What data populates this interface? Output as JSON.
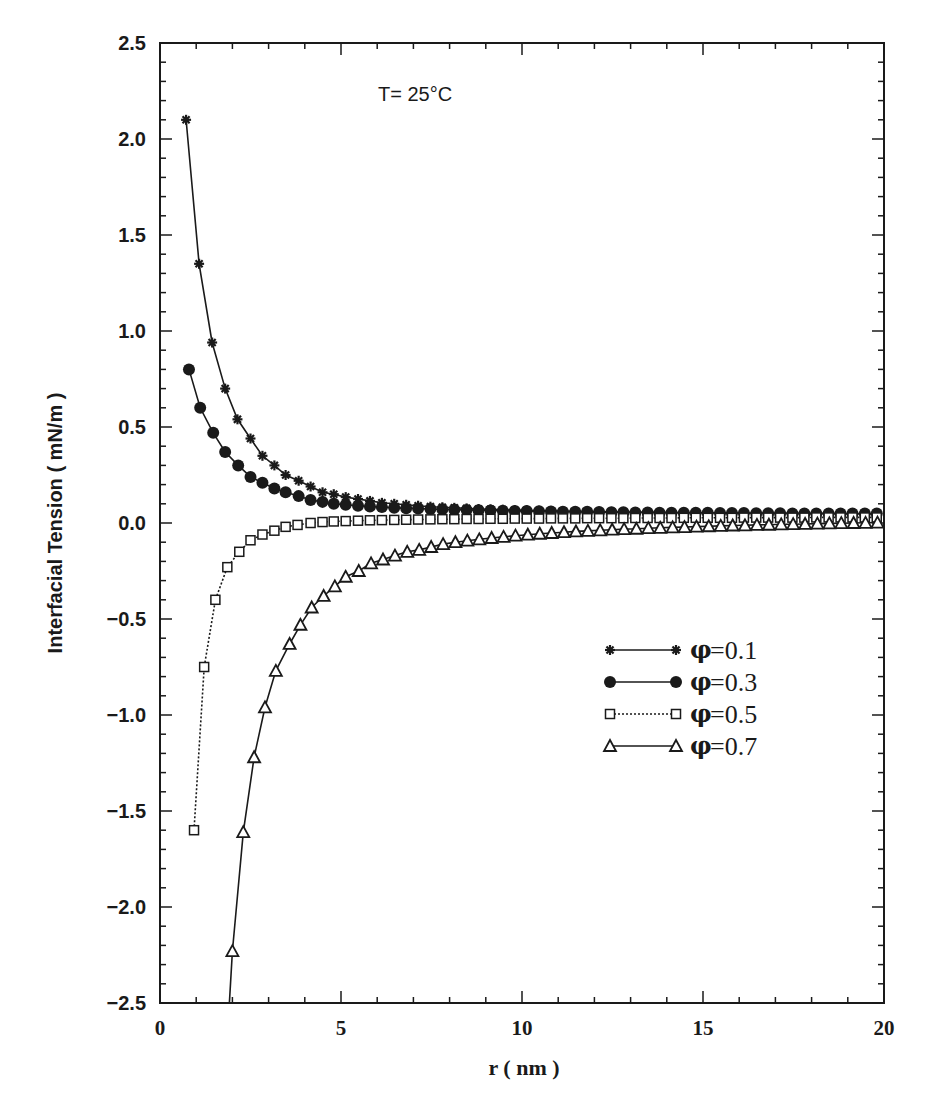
{
  "chart_data": {
    "type": "line",
    "title": "",
    "annotation": "T= 25°C",
    "xlabel": "r ( nm )",
    "ylabel": "Interfacial Tension ( mN/m )",
    "xlim": [
      0,
      20
    ],
    "ylim": [
      -2.5,
      2.5
    ],
    "x_ticks": [
      0,
      5,
      10,
      15,
      20
    ],
    "x_tick_labels": [
      "0",
      "5",
      "10",
      "15",
      "20"
    ],
    "y_ticks": [
      2.5,
      2.0,
      1.5,
      1.0,
      0.5,
      0.0,
      -0.5,
      -1.0,
      -1.5,
      -2.0,
      -2.5
    ],
    "y_tick_labels": [
      "2.5",
      "2.0",
      "1.5",
      "1.0",
      "0.5",
      "0.0",
      "-0.5",
      "-1.0",
      "-1.5",
      "-2.0",
      "-2.5"
    ],
    "grid": false,
    "legend_position": "center-right",
    "series": [
      {
        "name": "φ= 0.1",
        "legend_symbol": "φ",
        "legend_value": "= 0.1",
        "marker": "asterisk",
        "line": "solid",
        "x": [
          0.72,
          1.08,
          1.44,
          1.8,
          2.14,
          2.5,
          2.83,
          3.16,
          3.47,
          3.83,
          4.16,
          4.49,
          4.8,
          5.13,
          5.47,
          5.8,
          6.13,
          6.47,
          6.8,
          7.13,
          7.47,
          7.8,
          8.13,
          8.47,
          8.8,
          9.13,
          9.47,
          9.8,
          10.13,
          10.47,
          10.8,
          11.13,
          11.47,
          11.8,
          12.13,
          12.47,
          12.8,
          13.13,
          13.47,
          13.8,
          14.13,
          14.47,
          14.8,
          15.13,
          15.47,
          15.8,
          16.13,
          16.47,
          16.8,
          17.13,
          17.47,
          17.8,
          18.13,
          18.47,
          18.8,
          19.13,
          19.47,
          19.8
        ],
        "values": [
          2.1,
          1.35,
          0.94,
          0.7,
          0.54,
          0.44,
          0.35,
          0.3,
          0.25,
          0.22,
          0.19,
          0.16,
          0.15,
          0.135,
          0.125,
          0.115,
          0.105,
          0.1,
          0.095,
          0.09,
          0.085,
          0.082,
          0.079,
          0.076,
          0.073,
          0.071,
          0.069,
          0.067,
          0.066,
          0.064,
          0.063,
          0.062,
          0.061,
          0.06,
          0.059,
          0.058,
          0.057,
          0.056,
          0.056,
          0.055,
          0.054,
          0.054,
          0.053,
          0.053,
          0.052,
          0.052,
          0.051,
          0.051,
          0.05,
          0.05,
          0.05,
          0.049,
          0.049,
          0.049,
          0.048,
          0.048,
          0.048,
          0.047
        ]
      },
      {
        "name": "φ= 0.3",
        "legend_symbol": "φ",
        "legend_value": "= 0.3",
        "marker": "filled-circle",
        "line": "solid",
        "x": [
          0.8,
          1.11,
          1.47,
          1.8,
          2.16,
          2.5,
          2.83,
          3.16,
          3.47,
          3.83,
          4.16,
          4.49,
          4.8,
          5.13,
          5.47,
          5.8,
          6.13,
          6.47,
          6.8,
          7.13,
          7.47,
          7.8,
          8.13,
          8.47,
          8.8,
          9.13,
          9.47,
          9.8,
          10.13,
          10.47,
          10.8,
          11.13,
          11.47,
          11.8,
          12.13,
          12.47,
          12.8,
          13.13,
          13.47,
          13.8,
          14.13,
          14.47,
          14.8,
          15.13,
          15.47,
          15.8,
          16.13,
          16.47,
          16.8,
          17.13,
          17.47,
          17.8,
          18.13,
          18.47,
          18.8,
          19.13,
          19.47,
          19.8
        ],
        "values": [
          0.8,
          0.6,
          0.47,
          0.37,
          0.3,
          0.24,
          0.21,
          0.18,
          0.16,
          0.14,
          0.12,
          0.11,
          0.1,
          0.095,
          0.09,
          0.086,
          0.083,
          0.08,
          0.077,
          0.075,
          0.073,
          0.071,
          0.069,
          0.068,
          0.066,
          0.065,
          0.064,
          0.063,
          0.062,
          0.061,
          0.06,
          0.059,
          0.058,
          0.058,
          0.057,
          0.056,
          0.056,
          0.055,
          0.055,
          0.054,
          0.054,
          0.053,
          0.053,
          0.053,
          0.052,
          0.052,
          0.052,
          0.051,
          0.051,
          0.051,
          0.05,
          0.05,
          0.05,
          0.05,
          0.049,
          0.049,
          0.049,
          0.049
        ]
      },
      {
        "name": "φ= 0.5",
        "legend_symbol": "φ",
        "legend_value": "= 0.5",
        "marker": "open-square",
        "line": "dotted",
        "x": [
          0.94,
          1.22,
          1.53,
          1.86,
          2.19,
          2.5,
          2.83,
          3.16,
          3.47,
          3.8,
          4.16,
          4.49,
          4.8,
          5.13,
          5.47,
          5.8,
          6.13,
          6.47,
          6.8,
          7.13,
          7.47,
          7.8,
          8.13,
          8.47,
          8.8,
          9.13,
          9.47,
          9.8,
          10.13,
          10.47,
          10.8,
          11.13,
          11.47,
          11.8,
          12.13,
          12.47,
          12.8,
          13.13,
          13.47,
          13.8,
          14.13,
          14.47,
          14.8,
          15.13,
          15.47,
          15.8,
          16.13,
          16.47,
          16.8,
          17.13,
          17.47,
          17.8,
          18.13,
          18.47,
          18.8,
          19.13,
          19.47,
          19.8
        ],
        "values": [
          -1.6,
          -0.75,
          -0.4,
          -0.23,
          -0.15,
          -0.09,
          -0.06,
          -0.04,
          -0.02,
          -0.01,
          0.0,
          0.005,
          0.008,
          0.01,
          0.012,
          0.014,
          0.015,
          0.016,
          0.017,
          0.018,
          0.019,
          0.02,
          0.02,
          0.021,
          0.021,
          0.022,
          0.022,
          0.023,
          0.023,
          0.023,
          0.024,
          0.024,
          0.024,
          0.025,
          0.025,
          0.025,
          0.025,
          0.026,
          0.026,
          0.026,
          0.026,
          0.027,
          0.027,
          0.027,
          0.027,
          0.027,
          0.028,
          0.028,
          0.028,
          0.028,
          0.028,
          0.028,
          0.029,
          0.029,
          0.029,
          0.029,
          0.029,
          0.029
        ]
      },
      {
        "name": "φ= 0.7",
        "legend_symbol": "φ",
        "legend_value": "= 0.7",
        "marker": "open-triangle",
        "line": "solid",
        "x": [
          2.0,
          2.3,
          2.6,
          2.9,
          3.2,
          3.58,
          3.88,
          4.19,
          4.52,
          4.83,
          5.13,
          5.49,
          5.83,
          6.16,
          6.49,
          6.83,
          7.16,
          7.49,
          7.82,
          8.16,
          8.49,
          8.82,
          9.16,
          9.49,
          9.82,
          10.16,
          10.49,
          10.82,
          11.16,
          11.49,
          11.82,
          12.16,
          12.49,
          12.82,
          13.16,
          13.49,
          13.82,
          14.16,
          14.49,
          14.82,
          15.16,
          15.49,
          15.82,
          16.16,
          16.49,
          16.82,
          17.16,
          17.49,
          17.82,
          18.16,
          18.49,
          18.82,
          19.16,
          19.49,
          19.82
        ],
        "values": [
          -2.23,
          -1.61,
          -1.22,
          -0.96,
          -0.77,
          -0.63,
          -0.53,
          -0.44,
          -0.38,
          -0.33,
          -0.28,
          -0.25,
          -0.21,
          -0.19,
          -0.17,
          -0.15,
          -0.14,
          -0.125,
          -0.11,
          -0.1,
          -0.092,
          -0.085,
          -0.078,
          -0.072,
          -0.066,
          -0.061,
          -0.056,
          -0.052,
          -0.048,
          -0.044,
          -0.041,
          -0.038,
          -0.035,
          -0.032,
          -0.03,
          -0.027,
          -0.025,
          -0.023,
          -0.021,
          -0.019,
          -0.017,
          -0.015,
          -0.013,
          -0.012,
          -0.01,
          -0.009,
          -0.007,
          -0.006,
          -0.005,
          -0.003,
          -0.002,
          -0.001,
          0.0,
          0.001,
          0.002
        ]
      }
    ]
  },
  "legend_series_order": [
    0,
    1,
    2,
    3
  ]
}
